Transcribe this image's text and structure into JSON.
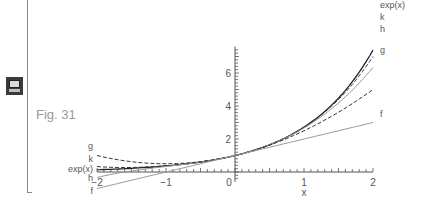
{
  "figure": {
    "caption": "Fig. 31",
    "icon": "monitor-icon"
  },
  "chart_data": {
    "type": "line",
    "title": "",
    "xlabel": "x",
    "ylabel": "",
    "xlim": [
      -2,
      2
    ],
    "ylim": [
      0,
      7.4
    ],
    "x_ticks": [
      "-2",
      "-1",
      "0",
      "1",
      "2"
    ],
    "y_ticks": [
      "2",
      "4",
      "6"
    ],
    "grid": false,
    "legend_position": "inline labels at curve ends",
    "series": [
      {
        "name": "exp(x)",
        "style": "solid dark",
        "description": "exponential function",
        "points": [
          [
            -2,
            0.14
          ],
          [
            -1,
            0.37
          ],
          [
            0,
            1
          ],
          [
            1,
            2.72
          ],
          [
            2,
            7.39
          ]
        ]
      },
      {
        "name": "k",
        "style": "dashed",
        "description": "4th-order Taylor polynomial",
        "points": [
          [
            -2,
            0.33
          ],
          [
            -1,
            0.38
          ],
          [
            0,
            1
          ],
          [
            1,
            2.71
          ],
          [
            2,
            7.0
          ]
        ]
      },
      {
        "name": "h",
        "style": "solid light",
        "description": "3rd-order Taylor polynomial",
        "points": [
          [
            -2,
            -0.33
          ],
          [
            -1,
            0.33
          ],
          [
            0,
            1
          ],
          [
            1,
            2.67
          ],
          [
            2,
            6.33
          ]
        ]
      },
      {
        "name": "g",
        "style": "dashed",
        "description": "2nd-order Taylor polynomial",
        "points": [
          [
            -2,
            1
          ],
          [
            -1,
            0.5
          ],
          [
            0,
            1
          ],
          [
            1,
            2.5
          ],
          [
            2,
            5
          ]
        ]
      },
      {
        "name": "f",
        "style": "solid light",
        "description": "1st-order Taylor polynomial",
        "points": [
          [
            -2,
            -1
          ],
          [
            -1,
            0
          ],
          [
            0,
            1
          ],
          [
            1,
            2
          ],
          [
            2,
            3
          ]
        ]
      }
    ]
  }
}
